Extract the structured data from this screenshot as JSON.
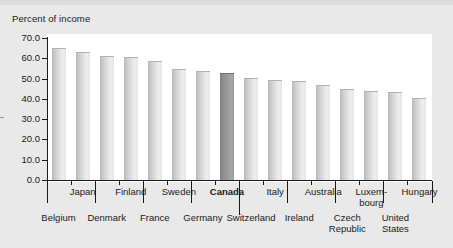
{
  "chart_data": {
    "type": "bar",
    "title": "",
    "subtitle": "",
    "ylabel": "Percent of income",
    "xlabel": "",
    "ylim": [
      0.0,
      70.0
    ],
    "ytick_labels": [
      "70.0",
      "60.0",
      "50.0",
      "40.0",
      "30.0",
      "20.0",
      "10.0",
      "0.0"
    ],
    "ytick_values": [
      70.0,
      60.0,
      50.0,
      40.0,
      30.0,
      20.0,
      10.0,
      0.0
    ],
    "grid": false,
    "legend": "none",
    "highlight_category": "Canada",
    "highlight_color": "#909090",
    "bar_color": "#dcdcdc",
    "categories": [
      "Belgium",
      "Japan",
      "Denmark",
      "Finland",
      "France",
      "Sweden",
      "Germany",
      "Canada",
      "Switzerland",
      "Italy",
      "Ireland",
      "Australia",
      "Czech Republic",
      "Luxembourg",
      "United States",
      "Hungary"
    ],
    "values": [
      65.0,
      63.0,
      61.0,
      60.5,
      58.5,
      54.5,
      53.5,
      53.0,
      50.5,
      49.5,
      49.0,
      47.0,
      45.0,
      44.0,
      43.5,
      40.5
    ],
    "tick_labels_row_upper": [
      "Japan",
      "Finland",
      "Sweden",
      "Canada",
      "Italy",
      "Australia",
      "Luxem-bourg",
      "Hungary"
    ],
    "tick_labels_row_lower": [
      "Belgium",
      "Denmark",
      "France",
      "Germany",
      "Switzerland",
      "Ireland",
      "Czech Republic",
      "United States"
    ]
  },
  "axis": {
    "y_caption": "Percent of income",
    "y_ticks": [
      {
        "label": "70.0",
        "value": 70.0
      },
      {
        "label": "60.0",
        "value": 60.0
      },
      {
        "label": "50.0",
        "value": 50.0
      },
      {
        "label": "40.0",
        "value": 40.0
      },
      {
        "label": "30.0",
        "value": 30.0
      },
      {
        "label": "20.0",
        "value": 20.0
      },
      {
        "label": "10.0",
        "value": 10.0
      },
      {
        "label": "0.0",
        "value": 0.0
      }
    ]
  },
  "x_labels_upper": [
    {
      "line1": "Japan",
      "line2": ""
    },
    {
      "line1": "Finland",
      "line2": ""
    },
    {
      "line1": "Sweden",
      "line2": ""
    },
    {
      "line1": "Canada",
      "line2": "",
      "bold": true
    },
    {
      "line1": "Italy",
      "line2": ""
    },
    {
      "line1": "Australia",
      "line2": ""
    },
    {
      "line1": "Luxem-",
      "line2": "bourg"
    },
    {
      "line1": "Hungary",
      "line2": ""
    }
  ],
  "x_labels_lower": [
    {
      "line1": "Belgium",
      "line2": ""
    },
    {
      "line1": "Denmark",
      "line2": ""
    },
    {
      "line1": "France",
      "line2": ""
    },
    {
      "line1": "Germany",
      "line2": ""
    },
    {
      "line1": "Switzerland",
      "line2": ""
    },
    {
      "line1": "Ireland",
      "line2": ""
    },
    {
      "line1": "Czech",
      "line2": "Republic"
    },
    {
      "line1": "United",
      "line2": "States"
    }
  ]
}
